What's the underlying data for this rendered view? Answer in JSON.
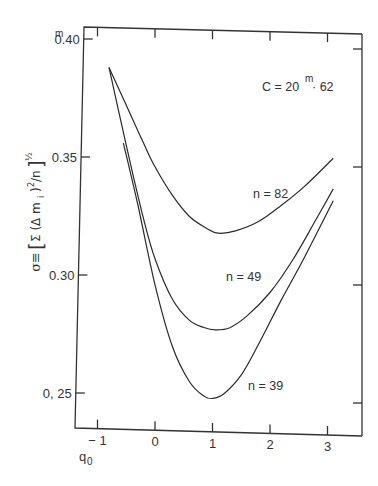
{
  "chart_data": {
    "type": "line",
    "title": "",
    "xlabel": "q0",
    "xlabel_main": "q",
    "xlabel_sub": "0",
    "ylabel": "σ ≡ [Σ(Δm_i)²/n]^½",
    "annotation": {
      "prefix": "C = 20",
      "sup": "m",
      "suffix": "· 62"
    },
    "x_ticks": [
      -1,
      0,
      1,
      2,
      3
    ],
    "x_tick_labels": [
      "− 1",
      "0",
      "1",
      "2",
      "3"
    ],
    "y_ticks": [
      0.25,
      0.3,
      0.35,
      0.4
    ],
    "y_tick_labels": [
      "0, 25",
      "0.30",
      "0.35",
      "0.40"
    ],
    "y_top_label_sup": "m",
    "xlim": [
      -1.4,
      3.45
    ],
    "ylim": [
      0.21,
      0.405
    ],
    "grid": false,
    "legend": "inline labels",
    "series": [
      {
        "name": "n=82",
        "label": "n = 82",
        "x": [
          -0.8,
          -0.5,
          -0.2,
          0.0,
          0.3,
          0.6,
          0.9,
          1.1,
          1.4,
          1.8,
          2.2,
          2.6,
          3.1
        ],
        "y": [
          0.388,
          0.372,
          0.356,
          0.346,
          0.334,
          0.325,
          0.32,
          0.318,
          0.319,
          0.323,
          0.33,
          0.338,
          0.35
        ]
      },
      {
        "name": "n=49",
        "label": "n = 49",
        "x": [
          -0.8,
          -0.5,
          -0.2,
          0.0,
          0.3,
          0.6,
          0.85,
          1.05,
          1.3,
          1.6,
          2.0,
          2.4,
          2.8,
          3.1
        ],
        "y": [
          0.388,
          0.355,
          0.324,
          0.307,
          0.29,
          0.281,
          0.278,
          0.277,
          0.278,
          0.283,
          0.293,
          0.307,
          0.324,
          0.337
        ]
      },
      {
        "name": "n=39",
        "label": "n = 39",
        "x": [
          -0.55,
          -0.3,
          0.0,
          0.3,
          0.6,
          0.85,
          1.0,
          1.2,
          1.5,
          1.8,
          2.2,
          2.6,
          3.1
        ],
        "y": [
          0.356,
          0.33,
          0.296,
          0.27,
          0.255,
          0.249,
          0.248,
          0.25,
          0.258,
          0.271,
          0.29,
          0.308,
          0.332
        ]
      }
    ]
  }
}
